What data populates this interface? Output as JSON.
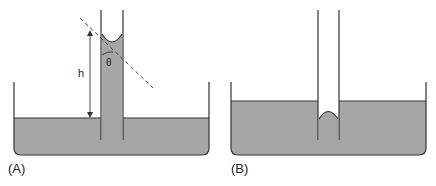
{
  "figure": {
    "panels": [
      {
        "id": "A",
        "label": "(A)",
        "description": "Capillary rise with concave meniscus (wetting liquid)"
      },
      {
        "id": "B",
        "label": "(B)",
        "description": "Capillary depression with convex meniscus (non-wetting liquid)"
      }
    ],
    "annotations": {
      "height_label": "h",
      "angle_label": "θ"
    },
    "colors": {
      "liquid": "#a6a6a6",
      "outline": "#333333",
      "background": "#ffffff"
    }
  }
}
